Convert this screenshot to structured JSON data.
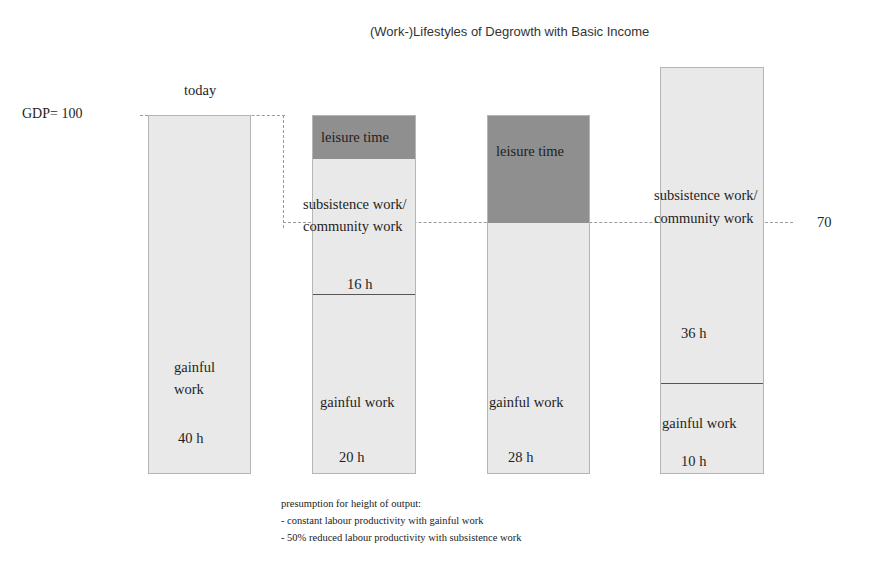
{
  "title": "(Work-)Lifestyles of Degrowth with Basic Income",
  "axis": {
    "gdp_label": "GDP= 100",
    "level_70_label": "70"
  },
  "bars": [
    {
      "header": "today",
      "segments": [
        {
          "label": "gainful work",
          "label_line1": "gainful",
          "label_line2": "work",
          "hours": "40 h"
        }
      ]
    },
    {
      "header": "",
      "segments": [
        {
          "label": "leisure time"
        },
        {
          "label_line1": "subsistence work/",
          "label_line2": "community work",
          "hours": "16 h"
        },
        {
          "label": "gainful work",
          "hours": "20 h"
        }
      ]
    },
    {
      "header": "",
      "segments": [
        {
          "label": "leisure time"
        },
        {
          "label": "gainful work",
          "hours": "28 h"
        }
      ]
    },
    {
      "header": "",
      "segments": [
        {
          "label_line1": "subsistence work/",
          "label_line2": "community work",
          "hours": "36 h"
        },
        {
          "label": "gainful work",
          "hours": "10 h"
        }
      ]
    }
  ],
  "notes": {
    "heading": "presumption for height of output:",
    "items": [
      "- constant labour productivity with gainful work",
      "- 50% reduced labour productivity with subsistence work"
    ]
  },
  "colors": {
    "light_fill": "#e9e9e9",
    "dark_fill": "#8f8f8f",
    "border": "#b5b5b5"
  }
}
